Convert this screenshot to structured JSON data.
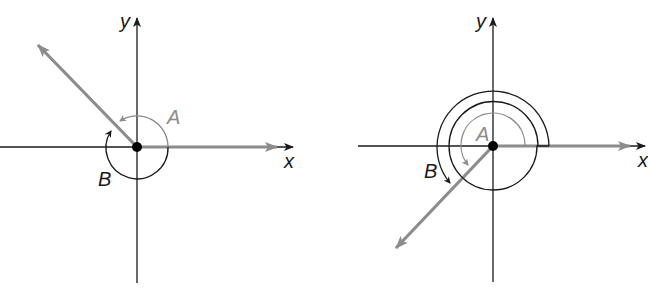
{
  "figures": [
    {
      "id": "left",
      "labels": {
        "y_axis": "y",
        "x_axis": "x",
        "angle_a": "A",
        "angle_b": "B"
      },
      "description": "Angle A measured counterclockwise from positive x-axis to terminal ray in quadrant II; angle B measured clockwise to the same ray"
    },
    {
      "id": "right",
      "labels": {
        "y_axis": "y",
        "x_axis": "x",
        "angle_a": "A",
        "angle_b": "B"
      },
      "description": "Angle A measured counterclockwise to terminal ray in quadrant III; angle B measured counterclockwise with one extra full rotation"
    }
  ],
  "colors": {
    "axis": "#1a1a1a",
    "ray": "#8c8c8c",
    "arc_a": "#8c8c8c",
    "arc_b": "#1a1a1a"
  }
}
